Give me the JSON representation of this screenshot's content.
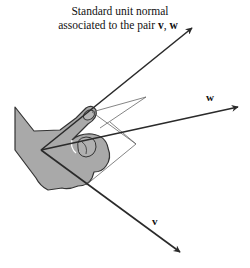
{
  "caption": {
    "line1": "Standard unit normal",
    "line2_prefix": "associated to the pair ",
    "v": "v",
    "sep": ", ",
    "w": "w"
  },
  "labels": {
    "w": "w",
    "v": "v"
  },
  "colors": {
    "hand_fill": "#a9a9a9",
    "hand_stroke": "#333333",
    "vector": "#2a2a2a",
    "frame": "#555555"
  },
  "vectors": [
    {
      "name": "normal",
      "from": [
        41,
        150
      ],
      "to": [
        192,
        28
      ]
    },
    {
      "name": "w",
      "from": [
        41,
        150
      ],
      "to": [
        238,
        107
      ]
    },
    {
      "name": "v",
      "from": [
        41,
        150
      ],
      "to": [
        180,
        252
      ]
    }
  ]
}
